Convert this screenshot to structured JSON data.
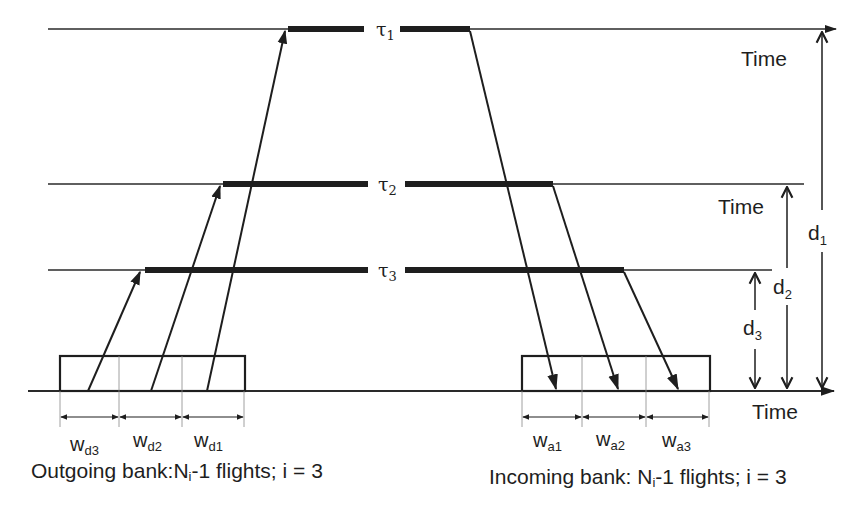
{
  "diagram": {
    "colors": {
      "ink": "#1e1e1e",
      "thin_line": "#2a2a2a",
      "background": "#ffffff"
    },
    "levels": [
      {
        "id": "tau1",
        "label": "τ",
        "sub": "1",
        "time_label": "Time"
      },
      {
        "id": "tau2",
        "label": "τ",
        "sub": "2",
        "time_label": "Time"
      },
      {
        "id": "tau3",
        "label": "τ",
        "sub": "3"
      }
    ],
    "distances": [
      {
        "label": "d",
        "sub": "1"
      },
      {
        "label": "d",
        "sub": "2"
      },
      {
        "label": "d",
        "sub": "3"
      }
    ],
    "base_time_label": "Time",
    "outgoing": {
      "windows": [
        {
          "label": "w",
          "sub": "d3"
        },
        {
          "label": "w",
          "sub": "d2"
        },
        {
          "label": "w",
          "sub": "d1"
        }
      ],
      "caption_pre": "Outgoing bank:N",
      "caption_sub": "i",
      "caption_post": "-1 flights; i = 3"
    },
    "incoming": {
      "windows": [
        {
          "label": "w",
          "sub": "a1"
        },
        {
          "label": "w",
          "sub": "a2"
        },
        {
          "label": "w",
          "sub": "a3"
        }
      ],
      "caption_pre": "Incoming bank: N",
      "caption_sub": "i",
      "caption_post": "-1 flights; i = 3"
    }
  }
}
